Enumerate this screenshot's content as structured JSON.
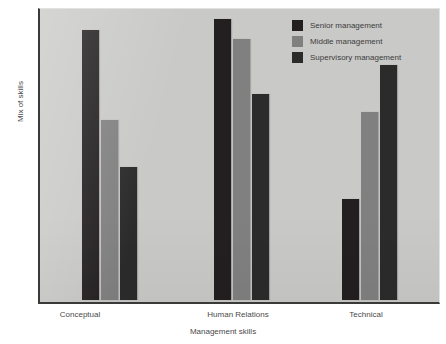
{
  "chart_data": {
    "type": "bar",
    "title": "",
    "xlabel": "Management skills",
    "ylabel": "Mix of skills",
    "categories": [
      "Conceptual",
      "Human Relations",
      "Technical"
    ],
    "series": [
      {
        "name": "Senior management",
        "color": "#231f20",
        "values": [
          93,
          97,
          35
        ]
      },
      {
        "name": "Middle management",
        "color": "#808080",
        "values": [
          62,
          90,
          65
        ]
      },
      {
        "name": "Supervisory management",
        "color": "#2b2b2b",
        "values": [
          46,
          71,
          81
        ]
      }
    ],
    "ylim": [
      0,
      100
    ],
    "grid": false,
    "axis_ticks_shown": false,
    "legend_position": "top-right"
  },
  "axes": {
    "xlabel": "Management skills",
    "ylabel": "Mix of skills",
    "tick_labels": [
      "Conceptual",
      "Human Relations",
      "Technical"
    ]
  },
  "legend": {
    "items": [
      {
        "label": "Senior management",
        "color": "#231f20"
      },
      {
        "label": "Middle management",
        "color": "#808080"
      },
      {
        "label": "Supervisory management",
        "color": "#2b2b2b"
      }
    ]
  },
  "style": {
    "plot_background": "#c9c9c7",
    "page_background": "#ffffff",
    "axis_color": "#3a3a3a",
    "text_color": "#4a4a4a"
  }
}
